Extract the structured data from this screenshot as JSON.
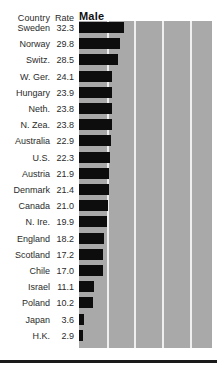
{
  "header": {
    "country_label": "Country",
    "rate_label": "Rate",
    "series_label": "Male"
  },
  "colors": {
    "plot_background": "#a9a9a9",
    "bar": "#0d0d0d",
    "gridline": "#efefef",
    "text": "#2b2b2b",
    "rule": "#1a1a1a"
  },
  "chart_data": {
    "type": "bar",
    "orientation": "horizontal",
    "title": "Male",
    "xlabel": "",
    "ylabel": "Country",
    "xlim": [
      0,
      96
    ],
    "grid": true,
    "gridlines": [
      20,
      40,
      60,
      80
    ],
    "legend": "none",
    "categories": [
      "Sweden",
      "Norway",
      "Switz.",
      "W. Ger.",
      "Hungary",
      "Neth.",
      "N. Zea.",
      "Australia",
      "U.S.",
      "Austria",
      "Denmark",
      "Canada",
      "N. Ire.",
      "England",
      "Scotland",
      "Chile",
      "Israel",
      "Poland",
      "Japan",
      "H.K."
    ],
    "values": [
      32.3,
      29.8,
      28.5,
      24.1,
      23.9,
      23.8,
      23.8,
      22.9,
      22.3,
      21.9,
      21.4,
      21.0,
      19.9,
      18.2,
      17.2,
      17.0,
      11.1,
      10.2,
      3.6,
      2.9
    ],
    "value_labels": [
      "32.3",
      "29.8",
      "28.5",
      "24.1",
      "23.9",
      "23.8",
      "23.8",
      "22.9",
      "22.3",
      "21.9",
      "21.4",
      "21.0",
      "19.9",
      "18.2",
      "17.2",
      "17.0",
      "11.1",
      "10.2",
      "3.6",
      "2.9"
    ]
  }
}
